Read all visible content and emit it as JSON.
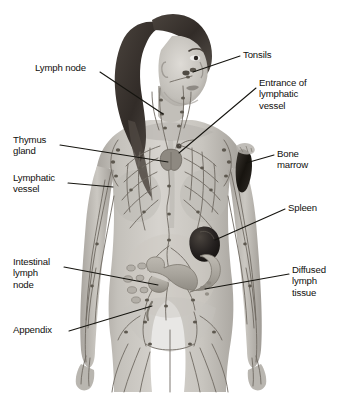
{
  "figure": {
    "background_color": "#ffffff",
    "label_color": "#100f0d",
    "leader_color": "#15140f",
    "width": 347,
    "height": 402
  },
  "labels": [
    {
      "id": "lymph-node",
      "text": "Lymph node",
      "side": "left",
      "x": 35,
      "y": 69,
      "lines": 1
    },
    {
      "id": "thymus-gland",
      "text": "Thymus\ngland",
      "side": "left",
      "x": 13,
      "y": 140,
      "lines": 2
    },
    {
      "id": "lymphatic-vessel",
      "text": "Lymphatic\nvessel",
      "side": "left",
      "x": 13,
      "y": 178,
      "lines": 2
    },
    {
      "id": "intestinal-lymph-node",
      "text": "Intestinal\nlymph\nnode",
      "side": "left",
      "x": 13,
      "y": 262,
      "lines": 3
    },
    {
      "id": "appendix",
      "text": "Appendix",
      "side": "left",
      "x": 13,
      "y": 327,
      "lines": 1
    },
    {
      "id": "tonsils",
      "text": "Tonsils",
      "side": "right",
      "x": 243,
      "y": 52,
      "lines": 1
    },
    {
      "id": "entrance-of-lymphatic-vessel",
      "text": "Entrance of\nlymphatic\nvessel",
      "side": "right",
      "x": 259,
      "y": 83,
      "lines": 3
    },
    {
      "id": "bone-marrow",
      "text": "Bone\nmarrow",
      "side": "right",
      "x": 277,
      "y": 150,
      "lines": 2
    },
    {
      "id": "spleen",
      "text": "Spleen",
      "side": "right",
      "x": 288,
      "y": 205,
      "lines": 1
    },
    {
      "id": "diffused-lymph-tissue",
      "text": "Diffused\nlymph\ntissue",
      "side": "right",
      "x": 292,
      "y": 270,
      "lines": 3
    }
  ],
  "leader_lines": [
    {
      "id": "leader-lymph-node",
      "from": [
        100,
        72
      ],
      "to": [
        163,
        114
      ]
    },
    {
      "id": "leader-thymus-gland",
      "from": [
        60,
        145
      ],
      "to": [
        168,
        162
      ]
    },
    {
      "id": "leader-lymphatic-vessel",
      "from": [
        68,
        183
      ],
      "to": [
        113,
        187
      ]
    },
    {
      "id": "leader-intestinal-lymph-node",
      "from": [
        64,
        267
      ],
      "to": [
        158,
        285
      ]
    },
    {
      "id": "leader-appendix",
      "from": [
        69,
        331
      ],
      "to": [
        152,
        306
      ]
    },
    {
      "id": "leader-tonsils",
      "from": [
        240,
        56
      ],
      "to": [
        193,
        72
      ]
    },
    {
      "id": "leader-entrance",
      "from": [
        256,
        88
      ],
      "to": [
        179,
        153
      ]
    },
    {
      "id": "leader-bone-marrow",
      "from": [
        274,
        155
      ],
      "to": [
        246,
        163
      ]
    },
    {
      "id": "leader-spleen",
      "from": [
        285,
        209
      ],
      "to": [
        215,
        240
      ]
    },
    {
      "id": "leader-diffused-lymph-tissue",
      "from": [
        289,
        274
      ],
      "to": [
        205,
        289
      ]
    }
  ],
  "anatomy": {
    "skin_tone": "#c9c6c0",
    "skin_shadow": "#9d9a95",
    "hair_color": "#3a3531",
    "vessel_color": "#6f6a62",
    "node_color": "#5d584f",
    "organ_dark": "#221f1c",
    "organs": [
      {
        "name": "tonsils",
        "kind": "node-pair"
      },
      {
        "name": "thymus",
        "kind": "gland"
      },
      {
        "name": "spleen",
        "kind": "organ-dark"
      },
      {
        "name": "bone-marrow",
        "kind": "cutaway-dark"
      },
      {
        "name": "intestines",
        "kind": "gut-loops"
      },
      {
        "name": "peyer-patches",
        "kind": "oval-nodes"
      },
      {
        "name": "appendix",
        "kind": "small-tube"
      }
    ]
  }
}
